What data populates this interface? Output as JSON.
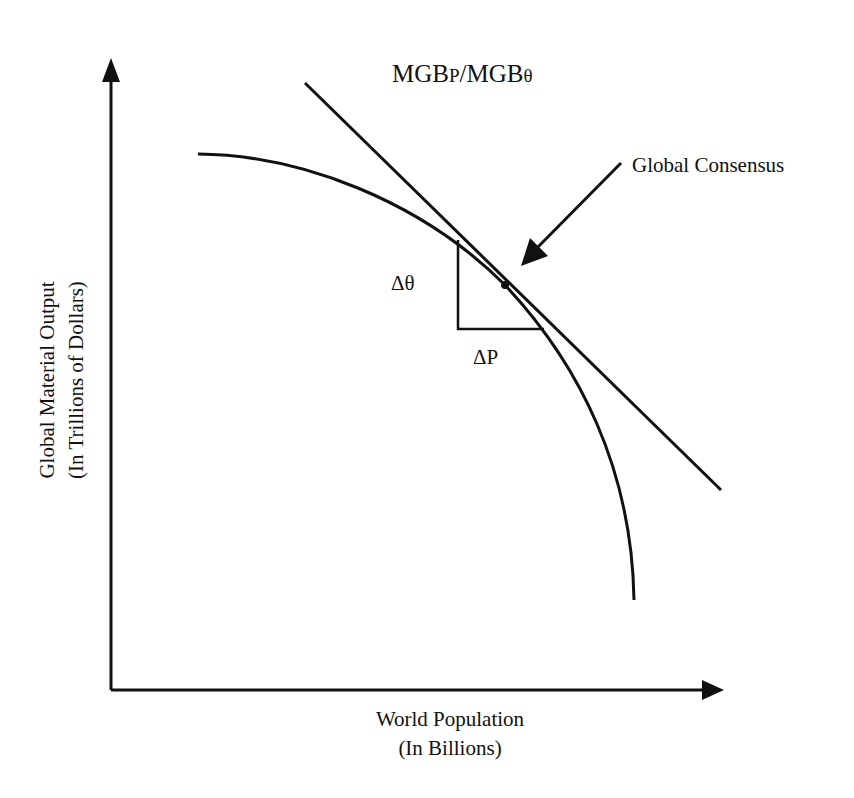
{
  "diagram": {
    "title": {
      "prefix": "MGB",
      "sub_p": "P",
      "separator": "/MGB",
      "sub_theta": "θ"
    },
    "annotations": {
      "callout": "Global Consensus",
      "delta_theta": "Δθ",
      "delta_p": "ΔP"
    },
    "axes": {
      "x_label_line1": "World Population",
      "x_label_line2": "(In Billions)",
      "y_label_line1": "Global Material Output",
      "y_label_line2": "(In Trillions of Dollars)"
    },
    "elements": {
      "curve": "production possibilities frontier (concave)",
      "tangent_line": "slope MGBP/MGBθ",
      "tangent_point": "Global Consensus point",
      "slope_triangle": "Δθ over ΔP"
    },
    "colors": {
      "ink": "#111111",
      "background": "#ffffff"
    }
  }
}
